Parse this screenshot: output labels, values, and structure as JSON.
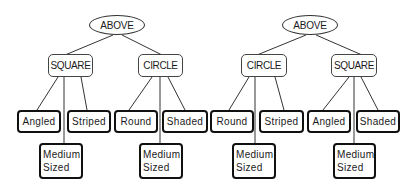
{
  "trees": [
    {
      "root": "ABOVE",
      "children": [
        {
          "label": "SQUARE",
          "leaves": [
            "Angled",
            "Striped"
          ],
          "lower_leaf": [
            "Medium",
            "Sized"
          ]
        },
        {
          "label": "CIRCLE",
          "leaves": [
            "Round",
            "Shaded"
          ],
          "lower_leaf": [
            "Medium",
            "Sized"
          ]
        }
      ]
    },
    {
      "root": "ABOVE",
      "children": [
        {
          "label": "CIRCLE",
          "leaves": [
            "Round",
            "Striped"
          ],
          "lower_leaf": [
            "Medium",
            "Sized"
          ]
        },
        {
          "label": "SQUARE",
          "leaves": [
            "Angled",
            "Shaded"
          ],
          "lower_leaf": [
            "Medium",
            "Sized"
          ]
        }
      ]
    }
  ],
  "colors": {
    "line": "#333333",
    "text": "#1a1a1a",
    "background": "#ffffff"
  }
}
